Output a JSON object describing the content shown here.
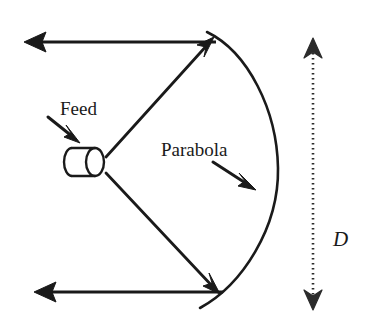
{
  "figure": {
    "type": "technical-diagram",
    "background_color": "#ffffff",
    "stroke_color": "#1a1a1a",
    "labels": {
      "feed": "Feed",
      "parabola": "Parabola",
      "diameter": "D"
    },
    "annotations": [
      {
        "name": "feed-pointer",
        "label": "Feed",
        "points_to": "feed-horn",
        "direction": "down-right"
      },
      {
        "name": "parabola-pointer",
        "label": "Parabola",
        "points_to": "parabola-curve",
        "direction": "down-right"
      },
      {
        "name": "diameter-dimension",
        "label": "D",
        "style": "dotted double-headed vertical arrow",
        "measures": "aperture diameter of the reflector"
      }
    ],
    "elements": [
      {
        "name": "feed-horn",
        "shape": "cylinder"
      },
      {
        "name": "parabola-curve",
        "shape": "parabolic arc opening left"
      },
      {
        "name": "upper-ray-to-reflector",
        "shape": "arrow"
      },
      {
        "name": "lower-ray-to-reflector",
        "shape": "arrow"
      },
      {
        "name": "upper-reflected-ray",
        "shape": "arrow pointing left"
      },
      {
        "name": "lower-reflected-ray",
        "shape": "arrow pointing left"
      }
    ]
  }
}
